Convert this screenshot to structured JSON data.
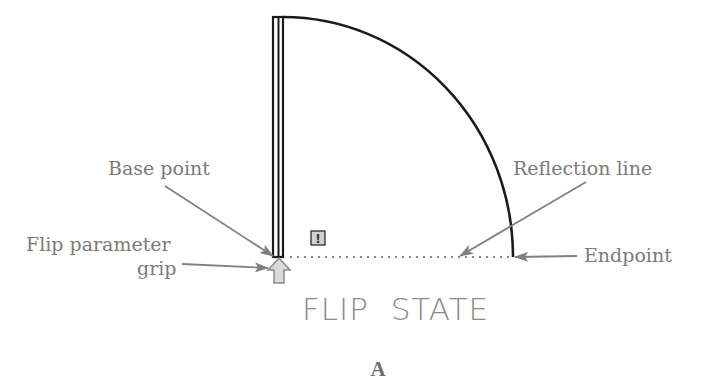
{
  "diagram": {
    "labels": {
      "base_point": "Base point",
      "flip_grip_line1": "Flip parameter",
      "flip_grip_line2": "grip",
      "reflection_line": "Reflection line",
      "endpoint": "Endpoint"
    },
    "state_text": "FLIP  STATE",
    "warning_icon": "!",
    "caption": "A",
    "colors": {
      "geometry": "#1a1a1a",
      "leader": "#808080",
      "label": "#7a7a7a",
      "grip_fill": "#d9d9d9",
      "warning_fill": "#d0d0d0"
    }
  }
}
